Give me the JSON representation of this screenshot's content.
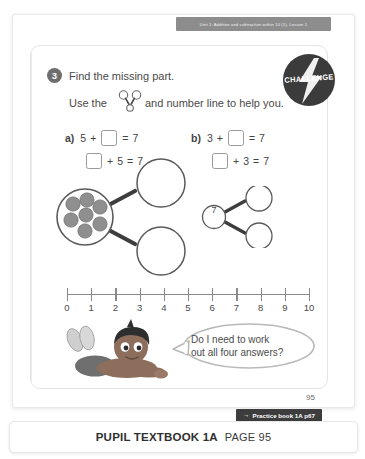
{
  "unit_banner": {
    "text": "Unit 1: Addition and subtraction within 10 (1), Lesson 1"
  },
  "challenge_badge": {
    "label": "CHALLENGE",
    "icon": "lightning-bolt-icon",
    "bg_color": "#3b3b3b"
  },
  "question": {
    "number": "3",
    "line_1": "Find the missing part.",
    "line_2_before": "Use the",
    "line_2_after": "and number line to help you.",
    "inline_icon": "part-whole-model-icon"
  },
  "equations": [
    {
      "id": "a1",
      "label": "a)",
      "tokens": [
        "5",
        "+",
        "box",
        "=",
        "7"
      ],
      "parts": {
        "left": "5",
        "plus": "+",
        "equals": "=",
        "total": "7"
      }
    },
    {
      "id": "a2",
      "label": "",
      "tokens": [
        "box",
        "+",
        "5",
        "=",
        "7"
      ],
      "parts": {
        "right": "5",
        "plus": "+",
        "equals": "=",
        "total": "7"
      }
    },
    {
      "id": "b1",
      "label": "b)",
      "tokens": [
        "3",
        "+",
        "box",
        "=",
        "7"
      ],
      "parts": {
        "left": "3",
        "plus": "+",
        "equals": "=",
        "total": "7"
      }
    },
    {
      "id": "b2",
      "label": "",
      "tokens": [
        "box",
        "+",
        "3",
        "=",
        "7"
      ],
      "parts": {
        "right": "3",
        "plus": "+",
        "equals": "=",
        "total": "7"
      }
    }
  ],
  "part_whole_big": {
    "whole_counters": 7,
    "counter_color": "#8f8f8f",
    "part_1_value": "",
    "part_2_value": "",
    "circle_stroke": "#5a5a5a"
  },
  "part_whole_small": {
    "whole_value": "7",
    "part_1_value": "",
    "part_2_value": "",
    "circle_stroke": "#5a5a5a"
  },
  "number_line": {
    "min": 0,
    "max": 10,
    "labels": [
      "0",
      "1",
      "2",
      "3",
      "4",
      "5",
      "6",
      "7",
      "8",
      "9",
      "10"
    ],
    "axis_color": "#8a8a8a"
  },
  "speech_bubble": {
    "line_1": "Do I need to work",
    "line_2": "out all four answers?",
    "character": "child-lying-down-illustration"
  },
  "sheet": {
    "page_number": "95"
  },
  "practice_pill": {
    "arrow": "→",
    "text": "Practice book 1A p67",
    "bg_color": "#3d3d3d"
  },
  "footer": {
    "title": "PUPIL TEXTBOOK 1A",
    "page_label": "PAGE 95"
  }
}
